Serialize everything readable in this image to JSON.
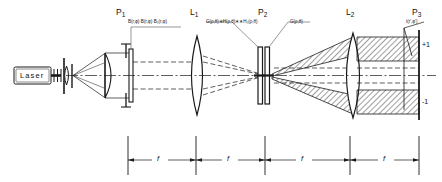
{
  "figure": {
    "type": "optical-system-diagram",
    "background_color": "#ffffff",
    "line_color": "#1a1a1a"
  },
  "source": {
    "label": "Laser",
    "name": "laser-source"
  },
  "planes": [
    {
      "id": "P1",
      "label": "P",
      "subscript": "1",
      "function_label": "B(r,φ)·B(r,φ)·B₀(r,φ)",
      "x": 131
    },
    {
      "id": "P2",
      "label": "P",
      "subscript": "2",
      "function_label_left": "G(ρ,θ)∗H(ρ,θ)∗∗H₀(ρ,θ)",
      "function_label_right": "G(ρ,θ)",
      "x": 265
    },
    {
      "id": "P3",
      "label": "P",
      "subscript": "3",
      "function_label": "t(r',φ')",
      "x": 419
    }
  ],
  "lenses": [
    {
      "id": "L1",
      "label": "L",
      "subscript": "1",
      "x": 197
    },
    {
      "id": "L2",
      "label": "L",
      "subscript": "2",
      "x": 353
    }
  ],
  "diffraction_orders": [
    {
      "label": "+1",
      "y": 45
    },
    {
      "label": "-1",
      "y": 102
    }
  ],
  "dimension_scale": {
    "segments": [
      {
        "label": "f",
        "from": 128,
        "to": 196
      },
      {
        "label": "f",
        "from": 196,
        "to": 265
      },
      {
        "label": "f",
        "from": 265,
        "to": 350
      },
      {
        "label": "f",
        "from": 350,
        "to": 419
      }
    ],
    "tick_positions": [
      128,
      196,
      265,
      350,
      419
    ],
    "axis_y": 160
  }
}
